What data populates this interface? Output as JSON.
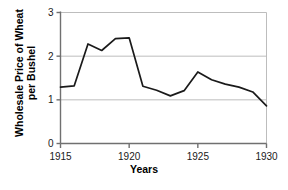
{
  "chart_data": {
    "type": "line",
    "title": "",
    "xlabel": "Years",
    "ylabel_lines": [
      "Wholesale Price of Wheat",
      "per Bushel"
    ],
    "ylabel": "Wholesale Price of Wheat per Bushel",
    "x": [
      1915,
      1916,
      1917,
      1918,
      1919,
      1920,
      1921,
      1922,
      1923,
      1924,
      1925,
      1926,
      1927,
      1928,
      1929,
      1930
    ],
    "values": [
      1.29,
      1.32,
      2.28,
      2.13,
      2.4,
      2.42,
      1.31,
      1.22,
      1.09,
      1.21,
      1.64,
      1.46,
      1.36,
      1.29,
      1.18,
      0.86
    ],
    "series": [
      {
        "name": "Wholesale Price of Wheat per Bushel",
        "values": [
          1.29,
          1.32,
          2.28,
          2.13,
          2.4,
          2.42,
          1.31,
          1.22,
          1.09,
          1.21,
          1.64,
          1.46,
          1.36,
          1.29,
          1.18,
          0.86
        ]
      }
    ],
    "xlim": [
      1915,
      1930
    ],
    "ylim": [
      0,
      3
    ],
    "xticks": [
      1915,
      1920,
      1925,
      1930
    ],
    "xtick_labels": [
      "1915",
      "1920",
      "1925",
      "1930"
    ],
    "yticks": [
      0,
      1,
      2,
      3
    ],
    "ytick_labels": [
      "0",
      "1",
      "2",
      "3"
    ],
    "grid": "horizontal",
    "legend": "none",
    "line_color": "#1a1a1a",
    "grid_color": "#b5b5b5",
    "axis_color": "#707070",
    "background": "#ffffff"
  }
}
